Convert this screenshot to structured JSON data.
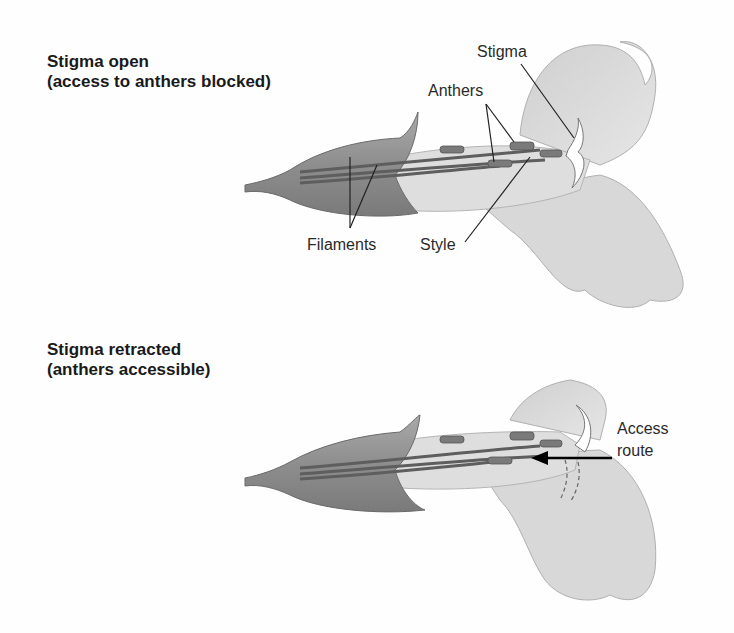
{
  "panels": [
    {
      "heading_line1": "Stigma open",
      "heading_line2": "(access to anthers blocked)",
      "labels": {
        "stigma": "Stigma",
        "anthers": "Anthers",
        "filaments": "Filaments",
        "style": "Style"
      }
    },
    {
      "heading_line1": "Stigma retracted",
      "heading_line2": "(anthers accessible)",
      "labels": {
        "access_line1": "Access",
        "access_line2": "route"
      }
    }
  ],
  "colors": {
    "calyx": "#8a8a8a",
    "petal": "#dcdcdc",
    "petal_shadow": "#bdbdbd",
    "filament": "#6e6e6e",
    "leader_line": "#222222",
    "arrow": "#000000"
  }
}
